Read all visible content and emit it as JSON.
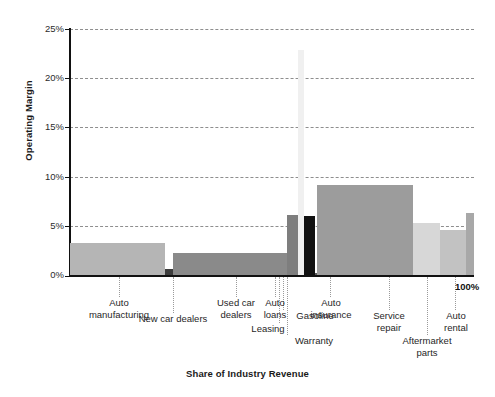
{
  "chart_data": {
    "type": "bar",
    "title": "",
    "xlabel": "Share of Industry Revenue",
    "ylabel": "Operating Margin",
    "ylim": [
      0,
      25
    ],
    "xlim": [
      0,
      100
    ],
    "grid": true,
    "legend": "none",
    "note": "Marimekko / variable-width bar chart: bar width = share of industry revenue (%), bar height = operating margin (%)",
    "y_ticks": [
      "0%",
      "5%",
      "10%",
      "15%",
      "20%",
      "25%"
    ],
    "y_tick_values": [
      0,
      5,
      10,
      15,
      20,
      25
    ],
    "x_end_label": "100%",
    "categories": [
      "Auto manufacturing",
      "New car dealers",
      "Used car dealers",
      "Auto loans",
      "Leasing",
      "Gasoline",
      "Warranty",
      "Auto insurance",
      "Service repair",
      "Aftermarket parts",
      "Auto rental"
    ],
    "values": [
      3.2,
      0.6,
      2.2,
      6.1,
      22.8,
      6.0,
      0.2,
      9.1,
      5.3,
      4.6,
      6.3
    ],
    "widths": [
      24.3,
      2.2,
      29.2,
      2.7,
      1.6,
      2.8,
      0.5,
      24.5,
      7.0,
      6.6,
      2.1
    ],
    "colors": [
      "#b5b5b5",
      "#3d3d3d",
      "#8a8a8a",
      "#7e7e7e",
      "#f0f0f0",
      "#111111",
      "#5a5a5a",
      "#9c9c9c",
      "#d7d7d7",
      "#c2c2c2",
      "#a8a8a8"
    ]
  },
  "labels": {
    "auto_manufacturing": "Auto\nmanufacturing",
    "new_car_dealers": "New car dealers",
    "used_car_dealers": "Used car\ndealers",
    "auto_loans": "Auto\nloans",
    "leasing": "Leasing",
    "gasoline": "Gasoline",
    "warranty": "Warranty",
    "auto_insurance": "Auto\ninsurance",
    "service_repair": "Service\nrepair",
    "aftermarket_parts": "Aftermarket\nparts",
    "auto_rental": "Auto\nrental"
  },
  "ticks": {
    "y0": "0%",
    "y5": "5%",
    "y10": "10%",
    "y15": "15%",
    "y20": "20%",
    "y25": "25%",
    "x_end": "100%"
  },
  "axis_titles": {
    "y": "Operating Margin",
    "x": "Share of Industry Revenue"
  }
}
